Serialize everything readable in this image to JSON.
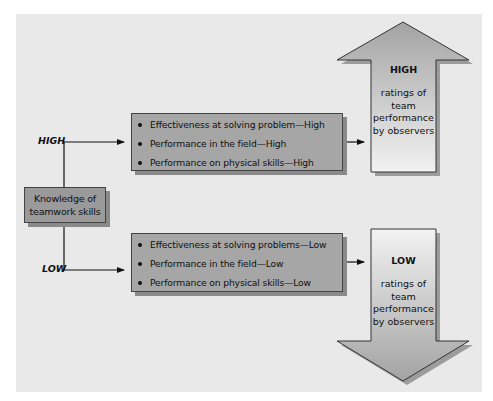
{
  "diagram": {
    "source_node": {
      "lines": [
        "Knowledge of",
        "teamwork skills"
      ]
    },
    "branches": [
      {
        "label": "HIGH",
        "outcomes": [
          "Effectiveness at solving problem—High",
          "Performance in the field—High",
          "Performance on physical skills—High"
        ],
        "result": {
          "direction": "up",
          "title": "HIGH",
          "description_lines": [
            "ratings of",
            "team",
            "performance",
            "by observers"
          ]
        }
      },
      {
        "label": "LOW",
        "outcomes": [
          "Effectiveness at solving problems—Low",
          "Performance in the field—Low",
          "Performance on physical skills—Low"
        ],
        "result": {
          "direction": "down",
          "title": "LOW",
          "description_lines": [
            "ratings of",
            "team",
            "performance",
            "by observers"
          ]
        }
      }
    ],
    "colors": {
      "panel_bg": "#e9e9e9",
      "box_fill": "#a6a6a6",
      "source_fill": "#9a9a9a",
      "shadow": "#8a8a8a",
      "line": "#111111"
    }
  }
}
